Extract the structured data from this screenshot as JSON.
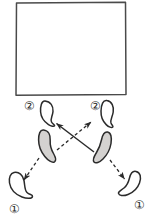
{
  "figure": {
    "background_color": "#ffffff",
    "ink_color": "#2b2b2b",
    "shaded_fill_color": "#d4d2d0",
    "hollow_fill_color": "#ffffff",
    "box": {
      "name": "rectangle-outline",
      "x": 16,
      "y": 2,
      "width": 110,
      "height": 93,
      "stroke_color": "#4a4a4a"
    },
    "labels": [
      {
        "id": "label-2-left",
        "text": "②",
        "x": 29,
        "y": 110
      },
      {
        "id": "label-2-right",
        "text": "②",
        "x": 95,
        "y": 110
      },
      {
        "id": "label-1-left",
        "text": "①",
        "x": 14,
        "y": 213
      },
      {
        "id": "label-1-right",
        "text": "①",
        "x": 139,
        "y": 209
      }
    ],
    "shapes": [
      {
        "id": "bean-upper-left",
        "role": "target-state-2-left",
        "fill": "hollow",
        "cx": 47,
        "cy": 114
      },
      {
        "id": "bean-upper-right",
        "role": "target-state-2-right",
        "fill": "hollow",
        "cx": 107,
        "cy": 114
      },
      {
        "id": "bean-center-left",
        "role": "source-shaded-left",
        "fill": "shaded",
        "cx": 46,
        "cy": 146
      },
      {
        "id": "bean-center-right",
        "role": "source-shaded-right",
        "fill": "shaded",
        "cx": 103,
        "cy": 148
      },
      {
        "id": "bean-lower-left",
        "role": "target-state-1-left",
        "fill": "hollow",
        "cx": 19,
        "cy": 185
      },
      {
        "id": "bean-lower-right",
        "role": "target-state-1-right",
        "fill": "hollow",
        "cx": 129,
        "cy": 183
      }
    ],
    "arrows": [
      {
        "id": "arrow-solid-right-to-upper-left",
        "style": "solid",
        "from": "bean-center-right",
        "to": "bean-upper-left"
      },
      {
        "id": "arrow-dashed-left-to-upper-right",
        "style": "dashed",
        "from": "bean-center-left",
        "to": "bean-upper-right"
      },
      {
        "id": "arrow-dashed-left-to-lower-left",
        "style": "dashed",
        "from": "bean-center-left",
        "to": "bean-lower-left"
      },
      {
        "id": "arrow-dashed-right-to-lower-right",
        "style": "dashed",
        "from": "bean-center-right",
        "to": "bean-lower-right"
      }
    ]
  }
}
